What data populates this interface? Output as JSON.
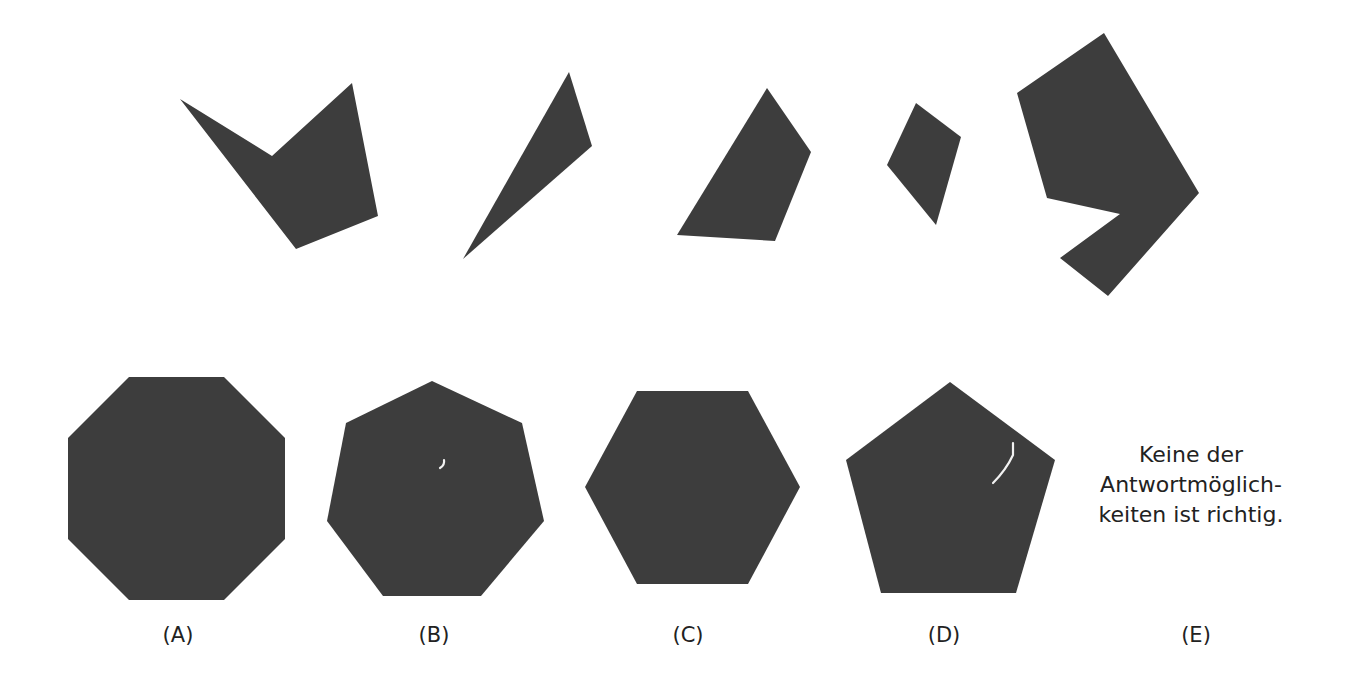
{
  "puzzle": {
    "pieces": [
      {
        "id": "piece-1",
        "shape": "concave-pentagon-arrowhead",
        "points": "180,99 272,156 352,83 378,216 296,249"
      },
      {
        "id": "piece-2",
        "shape": "thin-triangle",
        "points": "569,72 592,146 463,259"
      },
      {
        "id": "piece-3",
        "shape": "quadrilateral",
        "points": "767,88 811,152 775,241 677,235"
      },
      {
        "id": "piece-4",
        "shape": "kite",
        "points": "916,103 961,137 936,225 887,165"
      },
      {
        "id": "piece-5",
        "shape": "concave-heptagon",
        "points": "1104,33 1199,193 1108,296 1060,258 1120,214 1047,198 1017,93"
      }
    ],
    "fill_color": "#3d3d3d"
  },
  "options": [
    {
      "key": "A",
      "label": "(A)",
      "shape": "octagon",
      "points": "129,377 224,377 285,438 285,539 224,600 129,600 68,539 68,438"
    },
    {
      "key": "B",
      "label": "(B)",
      "shape": "heptagon",
      "points": "432,381 522,423 544,521 481,596 383,596 327,521 346,423"
    },
    {
      "key": "C",
      "label": "(C)",
      "shape": "hexagon",
      "points": "637,391 748,391 800,487 748,584 637,584 585,487"
    },
    {
      "key": "D",
      "label": "(D)",
      "shape": "pentagon",
      "points": "950,382 1055,460 1016,593 881,593 846,460"
    },
    {
      "key": "E",
      "label": "(E)",
      "shape": "text",
      "text_lines": [
        "Keine der",
        "Antwortmöglich-",
        "keiten ist richtig."
      ]
    }
  ]
}
